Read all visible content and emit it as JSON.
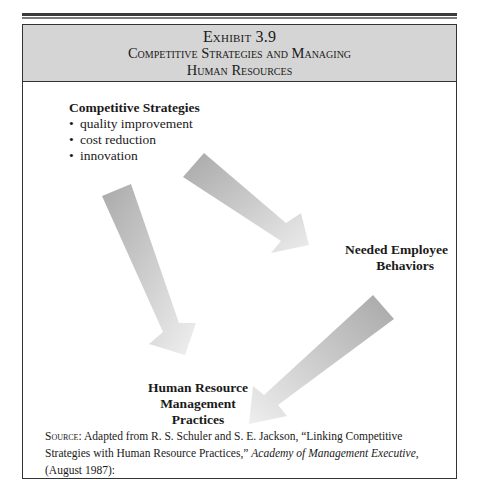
{
  "exhibit": {
    "number": "Exhibit 3.9",
    "title_line1": "Competitive Strategies and Managing",
    "title_line2": "Human Resources"
  },
  "nodes": {
    "strategies": {
      "title": "Competitive Strategies",
      "items": [
        "quality improvement",
        "cost reduction",
        "innovation"
      ],
      "bullet": "•"
    },
    "behaviors": {
      "line1": "Needed Employee",
      "line2": "Behaviors"
    },
    "hrm": {
      "line1": "Human Resource",
      "line2": "Management",
      "line3": "Practices"
    }
  },
  "arrows": [
    {
      "from": "strategies",
      "to": "behaviors",
      "color": "#b5b5b5"
    },
    {
      "from": "behaviors",
      "to": "hrm",
      "color": "#b5b5b5"
    },
    {
      "from": "strategies",
      "to": "hrm",
      "color": "#b5b5b5"
    }
  ],
  "source": {
    "label": "Source:",
    "text_part1": "Adapted from R. S. Schuler and S. E. Jackson, “Linking Competitive Strategies with Human Resource Practices,” ",
    "journal": "Academy of Management Executive",
    "text_part2": ", (August 1987):"
  },
  "colors": {
    "header_bg": "#d5d5d5",
    "border": "#333333",
    "arrow": "#b5b5b5"
  }
}
